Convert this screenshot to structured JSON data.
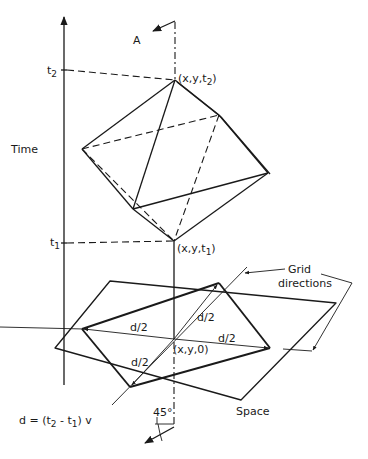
{
  "figure": {
    "axis": {
      "time_label": "Time",
      "t2_label": "t",
      "t2_sub": "2",
      "t1_label": "t",
      "t1_sub": "1"
    },
    "points": {
      "top_vertex": "(x,y,t",
      "top_vertex_sub": "2",
      "top_vertex_close": ")",
      "bottom_vertex": "(x,y,t",
      "bottom_vertex_sub": "1",
      "bottom_vertex_close": ")",
      "origin": "(x,y,0)"
    },
    "view_marker": "A",
    "grid": {
      "label_line1": "Grid",
      "label_line2": "directions"
    },
    "half_distance_labels": [
      "d/2",
      "d/2",
      "d/2",
      "d/2"
    ],
    "plane_label": "Space",
    "angle_label": "45°",
    "formula": {
      "prefix": "d = (t",
      "sub1": "2",
      "mid": " - t",
      "sub2": "1",
      "suffix": ") v"
    },
    "colors": {
      "ink": "#1a1a1a",
      "background": "#ffffff"
    }
  }
}
